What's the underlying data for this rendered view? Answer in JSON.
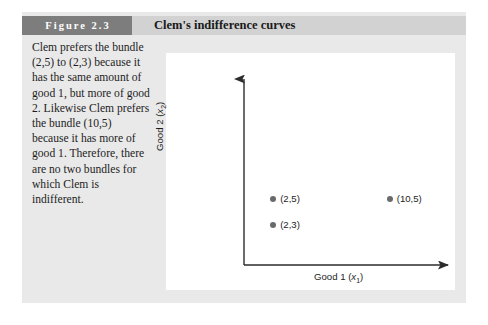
{
  "figure": {
    "number_label": "Figure 2.3",
    "title": "Clem's indifference curves",
    "caption": "Clem prefers the bundle (2,5) to (2,3) because it has the same amount of good 1, but more of good 2. Likewise Clem prefers the bundle (10,5) because it has more of good 1. Therefore, there are no two bundles for which Clem is indifferent.",
    "colors": {
      "box_background": "#e9e9e9",
      "number_box": "#7d7d7d",
      "title_band": "#d2d2d2",
      "panel_background": "#ffffff",
      "axis_line": "#2b2b2b",
      "marker": "#6a6a6a"
    }
  },
  "chart_data": {
    "type": "scatter",
    "title": "Clem's indifference curves",
    "xlabel_text": "Good 1",
    "xlabel_var": "x",
    "xlabel_sub": "1",
    "ylabel_text": "Good 2",
    "ylabel_var": "x",
    "ylabel_sub": "2",
    "grid": false,
    "legend": "none",
    "axis_arrows": true,
    "tick_labels": [],
    "xlim": [
      0,
      14
    ],
    "ylim": [
      0,
      14
    ],
    "points": [
      {
        "label": "(2,5)",
        "x": 2,
        "y": 5
      },
      {
        "label": "(2,3)",
        "x": 2,
        "y": 3
      },
      {
        "label": "(10,5)",
        "x": 10,
        "y": 5
      }
    ]
  }
}
